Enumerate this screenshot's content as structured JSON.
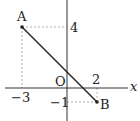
{
  "diagram": {
    "type": "coordinate-plane",
    "axes": {
      "x_label": "x",
      "origin_label": "O"
    },
    "points": [
      {
        "name": "A",
        "label": "A",
        "x": -3,
        "y": 4
      },
      {
        "name": "B",
        "label": "B",
        "x": 2,
        "y": -1
      }
    ],
    "tick_labels": {
      "x_neg": "−3",
      "x_pos": "2",
      "y_pos": "4",
      "y_neg": "−1"
    },
    "segment": {
      "from": "A",
      "to": "B"
    },
    "colors": {
      "line": "#222222",
      "dashed": "#999999",
      "axis": "#333333"
    }
  }
}
